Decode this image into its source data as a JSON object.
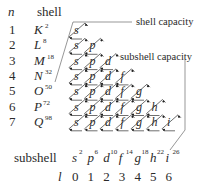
{
  "header": {
    "n_label": "n",
    "shell_label": "shell"
  },
  "annotations": {
    "shell_capacity": "shell capacity",
    "subshell_capacity": "subshell capacity"
  },
  "shells": [
    {
      "n": "1",
      "letter": "K",
      "capacity": "2"
    },
    {
      "n": "2",
      "letter": "L",
      "capacity": "8"
    },
    {
      "n": "3",
      "letter": "M",
      "capacity": "18"
    },
    {
      "n": "4",
      "letter": "N",
      "capacity": "32"
    },
    {
      "n": "5",
      "letter": "O",
      "capacity": "50"
    },
    {
      "n": "6",
      "letter": "P",
      "capacity": "72"
    },
    {
      "n": "7",
      "letter": "Q",
      "capacity": "98"
    }
  ],
  "footer": {
    "subshell_label": "subshell",
    "l_label": "l"
  },
  "subshells": [
    {
      "letter": "s",
      "capacity": "2",
      "l": "0"
    },
    {
      "letter": "p",
      "capacity": "6",
      "l": "1"
    },
    {
      "letter": "d",
      "capacity": "10",
      "l": "2"
    },
    {
      "letter": "f",
      "capacity": "14",
      "l": "3"
    },
    {
      "letter": "g",
      "capacity": "18",
      "l": "4"
    },
    {
      "letter": "h",
      "capacity": "22",
      "l": "5"
    },
    {
      "letter": "i",
      "capacity": "26",
      "l": "6"
    }
  ],
  "colors": {
    "text": "#2a2a2a",
    "line": "#4a4a4a",
    "background": "#ffffff"
  }
}
